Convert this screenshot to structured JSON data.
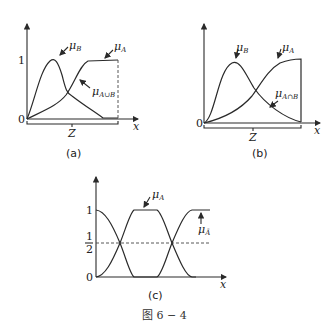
{
  "figure_caption": "图 6 − 4",
  "panels": [
    {
      "id": "a",
      "caption": "(a)",
      "y_ticks": [
        "1",
        "0"
      ],
      "x_axis_label": "x",
      "bracket_label": "Z",
      "curve_labels": {
        "mu_B": "μ",
        "mu_B_sub": "B",
        "mu_A": "μ",
        "mu_A_sub": "A",
        "union": "μ",
        "union_sub": "A∪B"
      }
    },
    {
      "id": "b",
      "caption": "(b)",
      "y_ticks": [
        "0"
      ],
      "x_axis_label": "x",
      "bracket_label": "Z",
      "curve_labels": {
        "mu_B": "μ",
        "mu_B_sub": "B",
        "mu_A": "μ",
        "mu_A_sub": "A",
        "intersection": "μ",
        "intersection_sub": "A∩B"
      }
    },
    {
      "id": "c",
      "caption": "(c)",
      "y_ticks": [
        "1",
        "1",
        "2",
        "0"
      ],
      "x_axis_label": "x",
      "curve_labels": {
        "mu_A": "μ",
        "mu_A_sub": "A",
        "mu_notA": "μ",
        "mu_notA_sub": "Ā"
      }
    }
  ]
}
